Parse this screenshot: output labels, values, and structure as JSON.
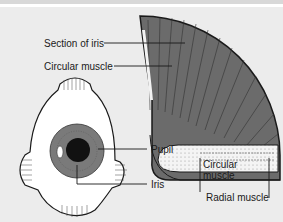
{
  "diagram": {
    "labels": {
      "section_of_iris": "Section of iris",
      "circular_muscle_top": "Circular muscle",
      "pupil": "Pupil",
      "iris": "Iris",
      "circular_muscle_bottom_line1": "Circular",
      "circular_muscle_bottom_line2": "muscle",
      "radial_muscle": "Radial muscle"
    },
    "colors": {
      "background": "#ececec",
      "iris_section": "#6b6b6b",
      "iris": "#7a7a7a",
      "pupil": "#111111",
      "line": "#1a1a1a"
    }
  }
}
